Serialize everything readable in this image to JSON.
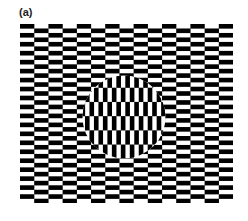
{
  "figure": {
    "panel_label": "(a)",
    "colors": {
      "background": "#ffffff",
      "dark": "#000000",
      "light": "#ffffff",
      "label": "#222222"
    },
    "pattern_area": {
      "x": 20,
      "y": 24,
      "width": 213,
      "height": 179
    },
    "background_tiles": {
      "orientation": "horizontal",
      "brick_width": 14.2,
      "row_height": 4.48,
      "columns": 15,
      "rows": 40
    },
    "disc": {
      "cx": 124,
      "cy": 117,
      "r": 41.5,
      "orientation": "vertical",
      "brick_height": 14.2,
      "column_width": 4.48
    }
  }
}
